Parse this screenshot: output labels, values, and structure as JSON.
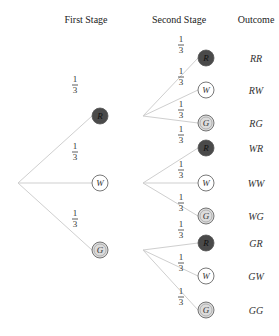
{
  "headers": {
    "first_stage": "First Stage",
    "second_stage": "Second Stage",
    "outcome": "Outcome"
  },
  "colors": {
    "R_fill": "#4a4a4a",
    "W_fill": "#ffffff",
    "G_fill": "#dcdcdc",
    "branch": "#cfcfcf"
  },
  "probability": {
    "num": "1",
    "den": "3"
  },
  "first_stage": [
    {
      "letter": "R",
      "prob": "1/3"
    },
    {
      "letter": "W",
      "prob": "1/3"
    },
    {
      "letter": "G",
      "prob": "1/3"
    }
  ],
  "second_stage": [
    {
      "letter": "R",
      "prob": "1/3",
      "outcome": "RR"
    },
    {
      "letter": "W",
      "prob": "1/3",
      "outcome": "RW"
    },
    {
      "letter": "G",
      "prob": "1/3",
      "outcome": "RG"
    },
    {
      "letter": "R",
      "prob": "1/3",
      "outcome": "WR"
    },
    {
      "letter": "W",
      "prob": "1/3",
      "outcome": "WW"
    },
    {
      "letter": "G",
      "prob": "1/3",
      "outcome": "WG"
    },
    {
      "letter": "R",
      "prob": "1/3",
      "outcome": "GR"
    },
    {
      "letter": "W",
      "prob": "1/3",
      "outcome": "GW"
    },
    {
      "letter": "G",
      "prob": "1/3",
      "outcome": "GG"
    }
  ]
}
